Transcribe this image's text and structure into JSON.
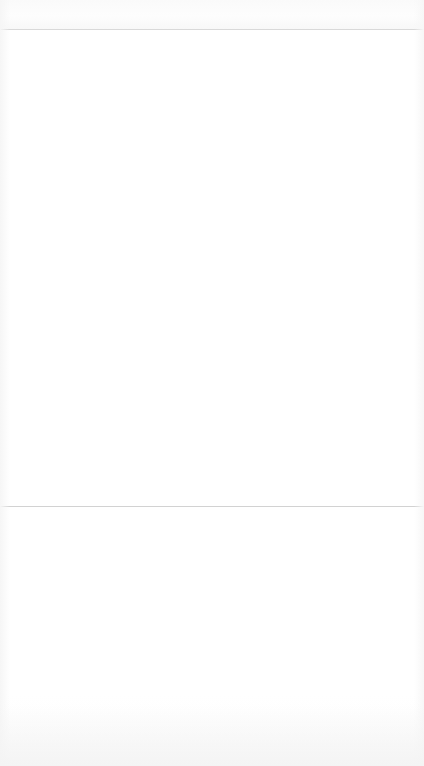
{
  "page": {
    "title": "",
    "state_label": "",
    "background_color": "#ffffff"
  },
  "top_bar": {
    "label": "",
    "background_color": "#fbfbfb",
    "height_px": "29"
  },
  "dividers": {
    "top_rule_color": "#d9d9d9",
    "top_rule_y": "29",
    "mid_rule_color": "#d2d2d2",
    "mid_rule_y": "506"
  },
  "content": {
    "placeholder": "",
    "background_color": "#ffffff"
  },
  "lower_panel": {
    "placeholder": "",
    "placeholder_secondary": "",
    "background_color": "#ffffff"
  }
}
